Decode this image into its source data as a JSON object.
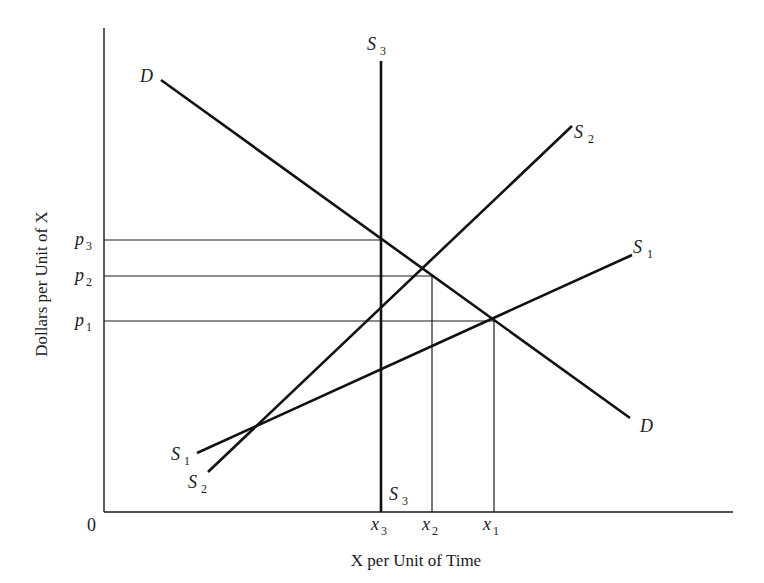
{
  "diagram": {
    "type": "supply-demand",
    "axes": {
      "ylabel": "Dollars per Unit of X",
      "xlabel": "X per Unit of Time",
      "origin": "0"
    },
    "curves": [
      {
        "id": "D",
        "label": "D",
        "sub": "",
        "kind": "demand"
      },
      {
        "id": "S1",
        "label": "S",
        "sub": "1",
        "kind": "supply"
      },
      {
        "id": "S2",
        "label": "S",
        "sub": "2",
        "kind": "supply"
      },
      {
        "id": "S3",
        "label": "S",
        "sub": "3",
        "kind": "supply-vertical"
      }
    ],
    "price_levels": [
      {
        "label": "p",
        "sub": "3"
      },
      {
        "label": "p",
        "sub": "2"
      },
      {
        "label": "p",
        "sub": "1"
      }
    ],
    "quantity_levels": [
      {
        "label": "x",
        "sub": "3"
      },
      {
        "label": "x",
        "sub": "2"
      },
      {
        "label": "x",
        "sub": "1"
      }
    ],
    "equilibria": [
      {
        "supply": "S3",
        "price": "p3",
        "quantity": "x3"
      },
      {
        "supply": "S2",
        "price": "p2",
        "quantity": "x2"
      },
      {
        "supply": "S1",
        "price": "p1",
        "quantity": "x1"
      }
    ],
    "colors": {
      "ink": "#111111",
      "background": "#ffffff"
    }
  }
}
